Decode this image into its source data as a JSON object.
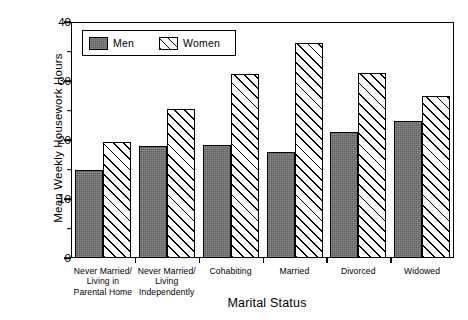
{
  "chart_data": {
    "type": "bar",
    "title": "",
    "xlabel": "Marital Status",
    "ylabel": "Mean Weekly Housework Hours",
    "ylim": [
      0,
      40
    ],
    "yticks": [
      0,
      10,
      20,
      30,
      40
    ],
    "yticks_minor": [
      5,
      15,
      25,
      35
    ],
    "grid": false,
    "legend_position": "top-left inside plot",
    "categories": [
      "Never Married/\nLiving in\nParental Home",
      "Never Married/\nLiving\nIndependently",
      "Cohabiting",
      "Married",
      "Divorced",
      "Widowed"
    ],
    "category_lines": [
      [
        "Never Married/",
        "Living in",
        "Parental Home"
      ],
      [
        "Never Married/",
        "Living",
        "Independently"
      ],
      [
        "Cohabiting"
      ],
      [
        "Married"
      ],
      [
        "Divorced"
      ],
      [
        "Widowed"
      ]
    ],
    "series": [
      {
        "name": "Men",
        "fill": "#6d6d6d",
        "pattern": "solid-gray",
        "values": [
          14.9,
          19.0,
          19.1,
          17.9,
          21.4,
          23.2
        ]
      },
      {
        "name": "Women",
        "fill": "#ffffff",
        "pattern": "diagonal-hatch",
        "values": [
          19.6,
          25.3,
          31.2,
          36.5,
          31.3,
          27.4
        ]
      }
    ]
  },
  "legend": {
    "items": [
      {
        "label": "Men"
      },
      {
        "label": "Women"
      }
    ]
  },
  "colors": {
    "axis": "#000000",
    "men_bar": "#6d6d6d",
    "women_bar": "#ffffff",
    "background": "#ffffff"
  }
}
